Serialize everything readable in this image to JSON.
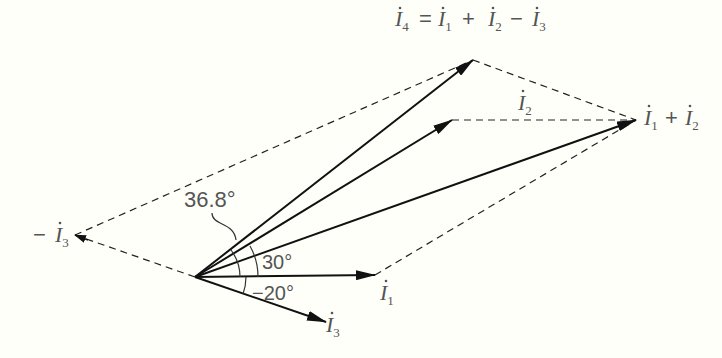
{
  "diagram": {
    "type": "phasor-diagram",
    "background": "#fffffa",
    "line_color": "#111111",
    "text_color": "#555555",
    "origin": [
      195,
      277
    ],
    "vectors": [
      {
        "id": "I1",
        "label_main": "I",
        "label_sub": "1",
        "tip": [
          375,
          275
        ],
        "angle_deg": 0
      },
      {
        "id": "I2",
        "label_main": "I",
        "label_sub": "2",
        "tip": [
          452,
          120
        ],
        "angle_deg": 30
      },
      {
        "id": "I3",
        "label_main": "I",
        "label_sub": "3",
        "tip": [
          326,
          322
        ],
        "angle_deg": -20
      },
      {
        "id": "minusI3",
        "label_prefix": "−",
        "label_main": "I",
        "label_sub": "3",
        "tip": [
          75,
          235
        ]
      },
      {
        "id": "I1plusI2",
        "tip": [
          636,
          120
        ]
      },
      {
        "id": "I4",
        "tip": [
          473,
          60
        ],
        "angle_deg": 36.8
      }
    ],
    "labels": {
      "i4_equation": {
        "i4": "I",
        "i4_sub": "4",
        "eq": "=",
        "i1": "I",
        "i1_sub": "1",
        "plus": "+",
        "i2": "I",
        "i2_sub": "2",
        "minus": "−",
        "i3": "I",
        "i3_sub": "3"
      },
      "i1_plus_i2": {
        "i1": "I",
        "i1_sub": "1",
        "plus": "+",
        "i2": "I",
        "i2_sub": "2"
      },
      "i2": {
        "main": "I",
        "sub": "2"
      },
      "i1": {
        "main": "I",
        "sub": "1"
      },
      "i3": {
        "main": "I",
        "sub": "3"
      },
      "minus_i3": {
        "prefix": "−",
        "main": "I",
        "sub": "3"
      }
    },
    "angles": {
      "a368": "36.8°",
      "a30": "30°",
      "am20": "−20°"
    }
  }
}
